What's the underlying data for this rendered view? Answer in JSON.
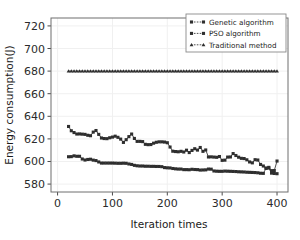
{
  "chart_data": {
    "type": "line",
    "title": "",
    "xlabel": "Iteration times",
    "ylabel": "Energy consumption(J)",
    "xlim": [
      -12,
      420
    ],
    "ylim": [
      573,
      727
    ],
    "xticks": [
      0,
      100,
      200,
      300,
      400
    ],
    "yticks": [
      580,
      600,
      620,
      640,
      660,
      680,
      700,
      720
    ],
    "grid": true,
    "legend_position": "upper right",
    "background_color": "#ffffff",
    "line_color": "#3a3a3a",
    "grid_color": "#f0f0f0",
    "x": [
      20,
      25,
      30,
      35,
      40,
      45,
      50,
      55,
      60,
      65,
      70,
      75,
      80,
      85,
      90,
      95,
      100,
      105,
      110,
      115,
      120,
      125,
      130,
      135,
      140,
      145,
      150,
      155,
      160,
      165,
      170,
      175,
      180,
      185,
      190,
      195,
      200,
      205,
      210,
      215,
      220,
      225,
      230,
      235,
      240,
      245,
      250,
      255,
      260,
      265,
      270,
      275,
      280,
      285,
      290,
      295,
      300,
      305,
      310,
      315,
      320,
      325,
      330,
      335,
      340,
      345,
      350,
      355,
      360,
      365,
      370,
      375,
      380,
      385,
      390,
      395,
      400
    ],
    "series": [
      {
        "name": "Genetic algorithm",
        "marker": "square",
        "values": [
          604.2,
          604.3,
          605.0,
          604.6,
          604.6,
          602.2,
          601.3,
          601.8,
          602.0,
          601.2,
          600.8,
          599.6,
          598.6,
          598.6,
          598.6,
          598.6,
          598.6,
          598.5,
          598.4,
          598.4,
          598.5,
          598.4,
          597.8,
          597.4,
          596.6,
          596.2,
          596.0,
          596.0,
          595.8,
          595.8,
          595.7,
          595.7,
          595.6,
          595.6,
          595.4,
          594.6,
          594.4,
          594.3,
          593.8,
          593.5,
          593.3,
          593.3,
          592.8,
          592.8,
          592.7,
          593.1,
          592.9,
          592.8,
          592.4,
          592.5,
          592.6,
          593.3,
          593.2,
          591.6,
          591.4,
          591.3,
          591.3,
          591.5,
          591.4,
          591.3,
          591.2,
          591.1,
          590.9,
          590.8,
          590.7,
          590.5,
          590.4,
          590.3,
          590.2,
          590.0,
          589.6,
          589.5,
          593.9,
          594.2,
          589.7,
          589.4,
          589.2
        ]
      },
      {
        "name": "PSO algorithm",
        "marker": "square",
        "values": [
          631.0,
          627.2,
          625.6,
          624.3,
          624.4,
          624.2,
          624.0,
          623.2,
          622.8,
          626.0,
          627.4,
          624.0,
          620.8,
          620.3,
          620.2,
          621.0,
          621.6,
          622.4,
          621.4,
          619.8,
          616.9,
          619.3,
          622.0,
          624.3,
          620.4,
          617.8,
          617.8,
          617.6,
          615.2,
          614.9,
          615.0,
          616.2,
          617.0,
          617.4,
          617.4,
          617.2,
          616.6,
          612.8,
          609.1,
          608.8,
          608.6,
          609.0,
          608.4,
          610.0,
          607.9,
          609.8,
          611.3,
          610.1,
          612.4,
          609.0,
          610.2,
          604.0,
          604.1,
          603.9,
          603.7,
          604.4,
          601.0,
          601.2,
          603.9,
          604.0,
          607.0,
          605.3,
          603.8,
          602.8,
          602.6,
          601.5,
          599.6,
          598.8,
          601.6,
          601.3,
          597.4,
          596.0,
          594.2,
          594.8,
          591.9,
          592.0,
          600.4
        ]
      },
      {
        "name": "Traditional method",
        "marker": "triangle",
        "constant_value": 680,
        "values": [
          680,
          680,
          680,
          680,
          680,
          680,
          680,
          680,
          680,
          680,
          680,
          680,
          680,
          680,
          680,
          680,
          680,
          680,
          680,
          680,
          680,
          680,
          680,
          680,
          680,
          680,
          680,
          680,
          680,
          680,
          680,
          680,
          680,
          680,
          680,
          680,
          680,
          680,
          680,
          680,
          680,
          680,
          680,
          680,
          680,
          680,
          680,
          680,
          680,
          680,
          680,
          680,
          680,
          680,
          680,
          680,
          680,
          680,
          680,
          680,
          680,
          680,
          680,
          680,
          680,
          680,
          680,
          680,
          680,
          680,
          680,
          680,
          680,
          680,
          680,
          680,
          680
        ]
      }
    ]
  },
  "legend": {
    "entries": [
      {
        "label": "Genetic algorithm",
        "marker": "square"
      },
      {
        "label": "PSO algorithm",
        "marker": "square"
      },
      {
        "label": "Traditional method",
        "marker": "triangle"
      }
    ]
  },
  "axes": {
    "x_tick_labels": [
      "0",
      "100",
      "200",
      "300",
      "400"
    ],
    "y_tick_labels": [
      "580",
      "600",
      "620",
      "640",
      "660",
      "680",
      "700",
      "720"
    ],
    "xlabel": "Iteration times",
    "ylabel": "Energy consumption(J)"
  }
}
